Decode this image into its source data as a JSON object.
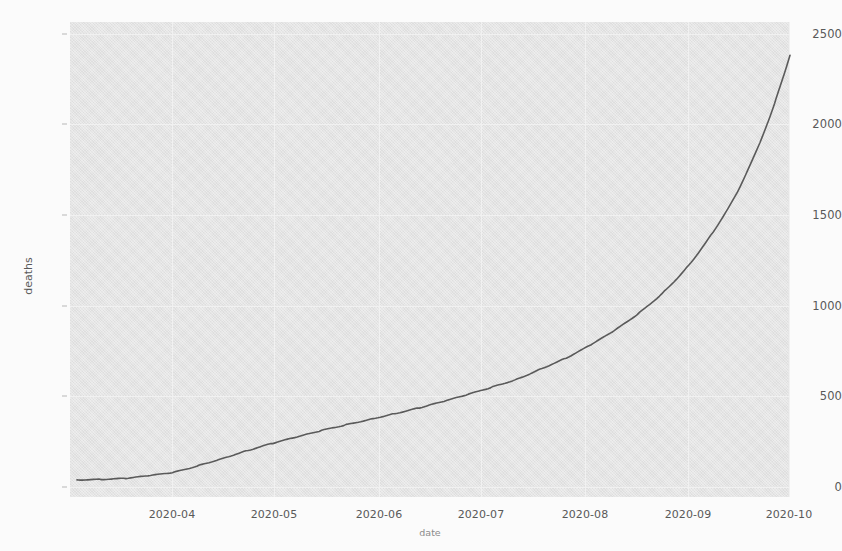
{
  "chart_data": {
    "type": "line",
    "title": "",
    "xlabel": "date",
    "ylabel": "deaths",
    "grid": true,
    "legend": "none",
    "line_color": "#5b5b5b",
    "plot_background": "#e6e6e6",
    "figure_background": "#fdfdfd",
    "xlim": [
      "2020-03-20",
      "2020-10-12"
    ],
    "ylim": [
      -95,
      2620
    ],
    "ytick_labels": [
      "0",
      "500",
      "1000",
      "1500",
      "2000",
      "2500"
    ],
    "ytick_values": [
      0,
      500,
      1000,
      1500,
      2000,
      2500
    ],
    "xtick_labels": [
      "2020-04",
      "2020-05",
      "2020-06",
      "2020-07",
      "2020-08",
      "2020-09",
      "2020-10"
    ],
    "series": [
      {
        "name": "deaths",
        "x": [
          "2020-03-22",
          "2020-03-29",
          "2020-04-05",
          "2020-04-12",
          "2020-04-19",
          "2020-04-26",
          "2020-05-03",
          "2020-05-10",
          "2020-05-17",
          "2020-05-24",
          "2020-05-31",
          "2020-06-07",
          "2020-06-14",
          "2020-06-21",
          "2020-06-28",
          "2020-07-05",
          "2020-07-12",
          "2020-07-19",
          "2020-07-26",
          "2020-08-02",
          "2020-08-09",
          "2020-08-16",
          "2020-08-23",
          "2020-08-30",
          "2020-09-06",
          "2020-09-13",
          "2020-09-20",
          "2020-09-27",
          "2020-10-04",
          "2020-10-08"
        ],
        "values": [
          3,
          6,
          12,
          28,
          48,
          86,
          128,
          172,
          212,
          248,
          285,
          318,
          350,
          382,
          415,
          452,
          492,
          535,
          580,
          640,
          700,
          775,
          860,
          960,
          1080,
          1230,
          1420,
          1650,
          1960,
          2180
        ],
        "final_value": 2430,
        "start_value": 3
      }
    ],
    "annotations": []
  },
  "axes": {
    "y_label_text": "deaths",
    "x_label_text": "date"
  },
  "ghost_text": {
    "note": "faint bleed-through text visible behind the scanned figure",
    "lines": []
  }
}
